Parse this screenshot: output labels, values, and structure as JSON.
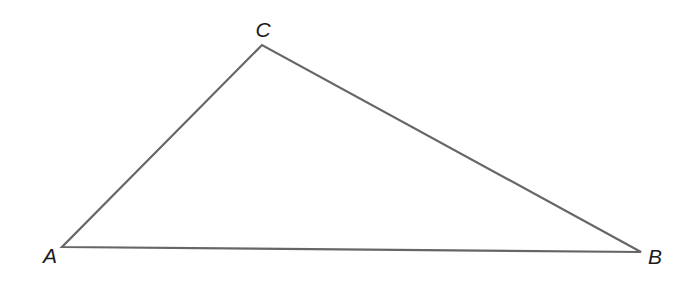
{
  "diagram": {
    "type": "triangle",
    "stroke_color": "#666666",
    "stroke_width": 2.2,
    "vertices": [
      {
        "name": "A",
        "x": 62,
        "y": 247,
        "label_x": 50,
        "label_y": 263
      },
      {
        "name": "B",
        "x": 641,
        "y": 252,
        "label_x": 655,
        "label_y": 264
      },
      {
        "name": "C",
        "x": 262,
        "y": 45,
        "label_x": 263,
        "label_y": 37
      }
    ],
    "labels": {
      "A": "A",
      "B": "B",
      "C": "C"
    }
  }
}
